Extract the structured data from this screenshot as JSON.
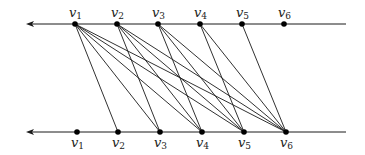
{
  "diagram": {
    "type": "bipartite-graph",
    "colors": {
      "stroke": "#1a1a1a",
      "node": "#000000"
    },
    "top_line": {
      "y": 24,
      "x_start": 26,
      "x_end": 346,
      "arrow": "left"
    },
    "bottom_line": {
      "y": 132,
      "x_start": 26,
      "x_end": 346,
      "arrow": "left"
    },
    "top_nodes": [
      {
        "id": "t1",
        "base": "v",
        "sub": "1",
        "x": 75
      },
      {
        "id": "t2",
        "base": "v",
        "sub": "2",
        "x": 117
      },
      {
        "id": "t3",
        "base": "v",
        "sub": "3",
        "x": 158
      },
      {
        "id": "t4",
        "base": "v",
        "sub": "4",
        "x": 200
      },
      {
        "id": "t5",
        "base": "v",
        "sub": "5",
        "x": 242
      },
      {
        "id": "t6",
        "base": "v",
        "sub": "6",
        "x": 284
      }
    ],
    "bottom_nodes": [
      {
        "id": "b1",
        "base": "v",
        "sub": "1",
        "x": 77
      },
      {
        "id": "b2",
        "base": "v",
        "sub": "2",
        "x": 118
      },
      {
        "id": "b3",
        "base": "v",
        "sub": "3",
        "x": 160
      },
      {
        "id": "b4",
        "base": "v",
        "sub": "4",
        "x": 202
      },
      {
        "id": "b5",
        "base": "v",
        "sub": "5",
        "x": 244
      },
      {
        "id": "b6",
        "base": "v",
        "sub": "6",
        "x": 286
      }
    ],
    "edges": [
      [
        "t1",
        "b2"
      ],
      [
        "t1",
        "b3"
      ],
      [
        "t1",
        "b4"
      ],
      [
        "t1",
        "b5"
      ],
      [
        "t1",
        "b6"
      ],
      [
        "t2",
        "b3"
      ],
      [
        "t2",
        "b4"
      ],
      [
        "t2",
        "b5"
      ],
      [
        "t2",
        "b6"
      ],
      [
        "t3",
        "b4"
      ],
      [
        "t3",
        "b5"
      ],
      [
        "t3",
        "b6"
      ],
      [
        "t4",
        "b5"
      ],
      [
        "t4",
        "b6"
      ],
      [
        "t5",
        "b6"
      ]
    ]
  }
}
